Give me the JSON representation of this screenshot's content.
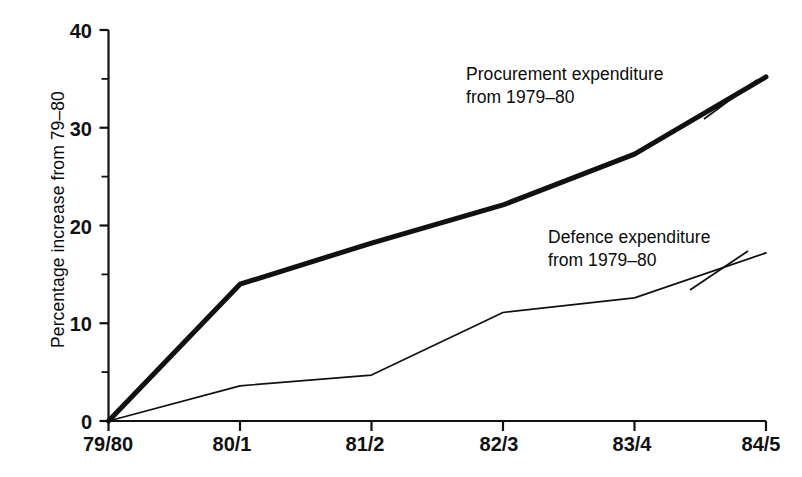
{
  "chart_data": {
    "type": "line",
    "title": "",
    "subtitle": "",
    "xlabel": "",
    "ylabel": "Percentage increase from 79–80",
    "categories": [
      "79/80",
      "80/1",
      "81/2",
      "82/3",
      "83/4",
      "84/5"
    ],
    "xtick_labels": [
      "79/80",
      "80/1",
      "81/2",
      "82/3",
      "83/4",
      "84/5"
    ],
    "ytick_labels": [
      "0",
      "10",
      "20",
      "30",
      "40"
    ],
    "ytick_values": [
      0,
      10,
      20,
      30,
      40
    ],
    "yminor_tick_values": [
      5,
      15,
      25,
      35
    ],
    "ylim": [
      0,
      40
    ],
    "grid": false,
    "legend_position": "inline-annotations",
    "series": [
      {
        "name": "Procurement expenditure from 1979–80",
        "label_line1": "Procurement expenditure",
        "label_line2": "from 1979–80",
        "color": "#111111",
        "line_width": 5,
        "values": [
          0,
          14.0,
          18.2,
          22.1,
          27.3,
          35.2
        ]
      },
      {
        "name": "Defence expenditure from 1979–80",
        "label_line1": "Defence expenditure",
        "label_line2": "from 1979–80",
        "color": "#111111",
        "line_width": 1.7,
        "values": [
          0,
          3.6,
          4.7,
          11.1,
          12.6,
          17.2
        ]
      }
    ],
    "annotations": [
      {
        "id": "procurement-annotation",
        "text": "Procurement expenditure\nfrom 1979–80"
      },
      {
        "id": "defence-annotation",
        "text": "Defence expenditure\nfrom 1979–80"
      }
    ]
  },
  "axis": {
    "y_title": "Percentage increase from 79–80",
    "y_labels": {
      "t0": "0",
      "t10": "10",
      "t20": "20",
      "t30": "30",
      "t40": "40"
    },
    "x_labels": {
      "c0": "79/80",
      "c1": "80/1",
      "c2": "81/2",
      "c3": "82/3",
      "c4": "83/4",
      "c5": "84/5"
    }
  }
}
